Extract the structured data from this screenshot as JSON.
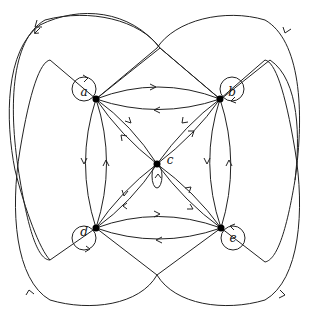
{
  "diagram": {
    "type": "directed-graph",
    "nodes": [
      {
        "id": "a",
        "label": "a",
        "x": 96,
        "y": 99
      },
      {
        "id": "b",
        "label": "b",
        "x": 220,
        "y": 99
      },
      {
        "id": "c",
        "label": "c",
        "x": 157,
        "y": 164
      },
      {
        "id": "d",
        "label": "d",
        "x": 96,
        "y": 228
      },
      {
        "id": "e",
        "label": "e",
        "x": 221,
        "y": 228
      }
    ],
    "edges": [
      {
        "from": "a",
        "to": "a",
        "kind": "loop"
      },
      {
        "from": "b",
        "to": "b",
        "kind": "loop"
      },
      {
        "from": "c",
        "to": "c",
        "kind": "loop"
      },
      {
        "from": "d",
        "to": "d",
        "kind": "loop"
      },
      {
        "from": "e",
        "to": "e",
        "kind": "loop"
      },
      {
        "from": "a",
        "to": "b"
      },
      {
        "from": "b",
        "to": "a"
      },
      {
        "from": "d",
        "to": "e"
      },
      {
        "from": "e",
        "to": "d"
      },
      {
        "from": "a",
        "to": "d"
      },
      {
        "from": "d",
        "to": "a"
      },
      {
        "from": "b",
        "to": "e"
      },
      {
        "from": "e",
        "to": "b"
      },
      {
        "from": "a",
        "to": "c"
      },
      {
        "from": "c",
        "to": "a"
      },
      {
        "from": "b",
        "to": "c"
      },
      {
        "from": "c",
        "to": "b"
      },
      {
        "from": "d",
        "to": "c"
      },
      {
        "from": "c",
        "to": "d"
      },
      {
        "from": "e",
        "to": "c"
      },
      {
        "from": "c",
        "to": "e"
      },
      {
        "from": "a",
        "to": "e",
        "kind": "outer-loop"
      },
      {
        "from": "b",
        "to": "d",
        "kind": "outer-loop"
      },
      {
        "from": "d",
        "to": "b",
        "kind": "outer-loop"
      },
      {
        "from": "e",
        "to": "a",
        "kind": "outer-loop"
      }
    ]
  }
}
